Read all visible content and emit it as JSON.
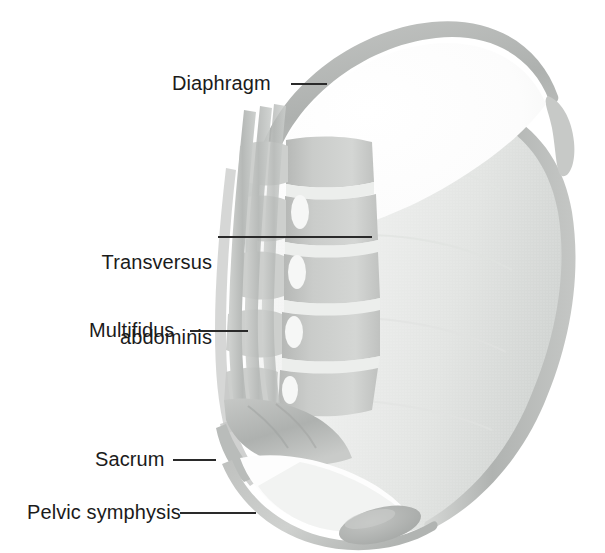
{
  "figure": {
    "width": 605,
    "height": 553,
    "background_color": "#ffffff"
  },
  "palette": {
    "label_text": "#1b1b1b",
    "leader_line": "#2a2a2a",
    "abdominal_wall": "#b9bcbb",
    "abdominal_interior": "#eef0ef",
    "diaphragm_arc": "#b5b8b6",
    "vertebra_body": "#c9cac8",
    "vertebra_disc": "#f2f3f1",
    "muscle_strand": "#c2c4c2",
    "sacrum": "#b4b7b5",
    "pelvic_floor": "#c6c8c6",
    "pubic_symphysis": "#b0b3b1",
    "cavity_white": "#fdfdfd"
  },
  "labels": [
    {
      "id": "diaphragm",
      "text": "Diaphragm",
      "lines": [
        "Diaphragm"
      ],
      "align": "left",
      "text_left": 172,
      "text_top": 71,
      "leader": {
        "x1": 291,
        "y1": 84,
        "x2": 327,
        "y2": 84
      }
    },
    {
      "id": "transversus-abdominis",
      "text": "Transversus abdominis",
      "lines": [
        "Transversus",
        "abdominis"
      ],
      "align": "right",
      "text_left": 96,
      "text_top": 200,
      "text_width": 116,
      "leader": {
        "x1": 218,
        "y1": 237,
        "x2": 372,
        "y2": 237
      }
    },
    {
      "id": "multifidus",
      "text": "Multifidus",
      "lines": [
        "Multifidus"
      ],
      "align": "left",
      "text_left": 89,
      "text_top": 318,
      "leader": {
        "x1": 190,
        "y1": 331,
        "x2": 248,
        "y2": 331
      }
    },
    {
      "id": "sacrum",
      "text": "Sacrum",
      "lines": [
        "Sacrum"
      ],
      "align": "left",
      "text_left": 95,
      "text_top": 447,
      "leader": {
        "x1": 173,
        "y1": 460,
        "x2": 216,
        "y2": 460
      }
    },
    {
      "id": "pelvic-symphysis",
      "text": "Pelvic symphysis",
      "lines": [
        "Pelvic symphysis"
      ],
      "align": "left",
      "text_left": 27,
      "text_top": 500,
      "leader": {
        "x1": 180,
        "y1": 513,
        "x2": 256,
        "y2": 513
      }
    }
  ],
  "structures": [
    {
      "id": "diaphragm-dome",
      "name": "diaphragm",
      "description": "thin grey elliptical arc forming the upper dome of the abdominal cavity"
    },
    {
      "id": "transversus-abdominis-wall",
      "name": "transversus abdominis",
      "description": "broad pale grey sheet forming the anterior and lateral abdominal wall"
    },
    {
      "id": "lumbar-spine",
      "name": "lumbar vertebrae",
      "description": "stack of five vertebral bodies with intervertebral discs and spinous processes"
    },
    {
      "id": "multifidus-muscle",
      "name": "multifidus",
      "description": "vertical muscle strands running along the posterior spine"
    },
    {
      "id": "sacrum-bone",
      "name": "sacrum",
      "description": "triangular bone at the base of the lumbar spine"
    },
    {
      "id": "pelvic-floor-sling",
      "name": "pelvic floor",
      "description": "curved sling at the base of the cavity"
    },
    {
      "id": "pubic-symphysis-joint",
      "name": "pelvic symphysis",
      "description": "darker grey blob at the anteroinferior rim of the pelvic floor"
    }
  ]
}
